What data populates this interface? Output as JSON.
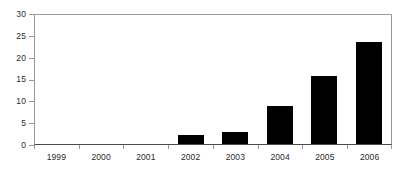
{
  "chart_data": {
    "type": "bar",
    "title": "",
    "subtitle": "",
    "xlabel": "",
    "ylabel": "",
    "categories": [
      "1999",
      "2000",
      "2001",
      "2002",
      "2003",
      "2004",
      "2005",
      "2006"
    ],
    "values": [
      0,
      0,
      0,
      2,
      3,
      9,
      16,
      24
    ],
    "values_measured": [
      0,
      0,
      0,
      2.0,
      2.8,
      8.8,
      15.8,
      23.7
    ],
    "ylim": [
      0,
      30
    ],
    "yticks": [
      0,
      5,
      10,
      15,
      20,
      25,
      30
    ],
    "ytick_labels": [
      "0",
      "5",
      "10",
      "15",
      "20",
      "25",
      "30"
    ],
    "xtick_labels": [
      "1999",
      "2000",
      "2001",
      "2002",
      "2003",
      "2004",
      "2005",
      "2006"
    ],
    "grid": false,
    "legend": false,
    "legend_position": "none",
    "series": [
      {
        "name": "",
        "color": "#000000",
        "values": [
          0,
          0,
          0,
          2,
          3,
          9,
          16,
          24
        ]
      }
    ],
    "annotations": [],
    "colors": {
      "bar": "#000000",
      "axis": "#4a4a4a",
      "frame": "#9a9a9a",
      "tick_label": "#2b2b2b",
      "background": "#ffffff"
    }
  }
}
